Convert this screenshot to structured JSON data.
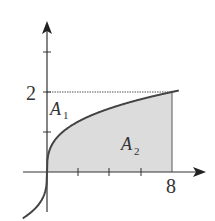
{
  "diagram": {
    "function": "y = x^(1/3)",
    "x_axis": {
      "tick_label": "8",
      "ticks": [
        2,
        4,
        6,
        8
      ]
    },
    "y_axis": {
      "tick_label": "2",
      "ticks": [
        1,
        2,
        3
      ]
    },
    "regions": [
      {
        "name": "A",
        "sub": "1",
        "description": "region between curve and y-axis, below y=2"
      },
      {
        "name": "A",
        "sub": "2",
        "description": "shaded region under curve from x=0 to x=8"
      }
    ],
    "colors": {
      "shade": "#dcdcdc",
      "curve": "#444444",
      "axis": "#333333"
    }
  }
}
